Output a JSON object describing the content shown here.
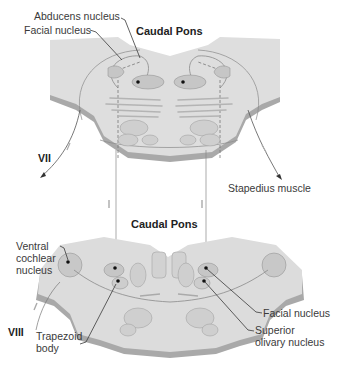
{
  "diagram": {
    "colors": {
      "tissue": "#dcdcdc",
      "tissue_dark": "#a9a9a9",
      "nucleus": "#c6c6c6",
      "outline": "#8a8a8a",
      "leader": "#3a3a3a",
      "text": "#3a3a3a"
    },
    "top_section": {
      "title": "Caudal Pons",
      "labels": {
        "abducens": "Abducens nucleus",
        "facial": "Facial nucleus",
        "nerve": "VII",
        "target": "Stapedius muscle"
      }
    },
    "bottom_section": {
      "title": "Caudal Pons",
      "labels": {
        "ventral_cochlear": "Ventral\ncochlear\nnucleus",
        "nerve": "VIII",
        "trapezoid": "Trapezoid\nbody",
        "facial": "Facial nucleus",
        "superior_olivary": "Superior\nolivary nucleus"
      }
    }
  }
}
